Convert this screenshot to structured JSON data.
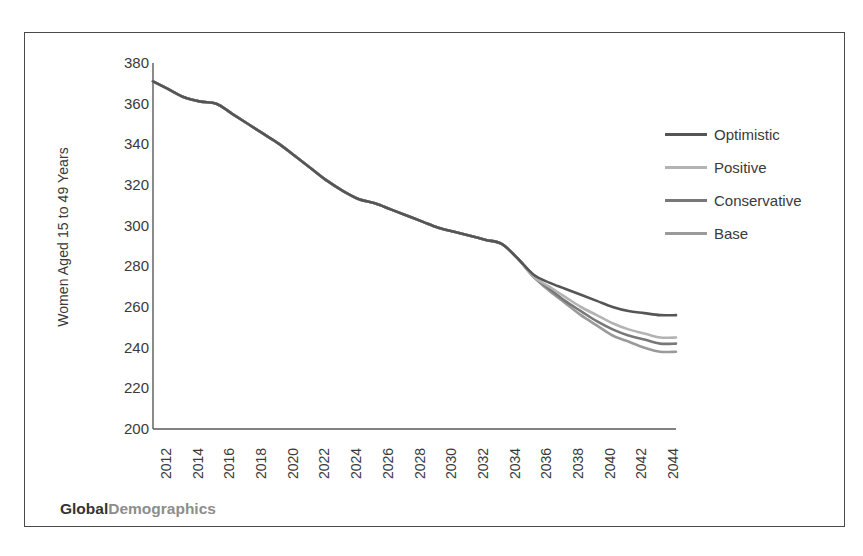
{
  "branding": {
    "primary": "Global",
    "secondary": "Demographics"
  },
  "legend": {
    "position": "inside-right",
    "items": [
      {
        "label": "Optimistic",
        "color": "#555555"
      },
      {
        "label": "Positive",
        "color": "#b3b3b3"
      },
      {
        "label": "Conservative",
        "color": "#787878"
      },
      {
        "label": "Base",
        "color": "#9a9a9a"
      }
    ]
  },
  "chart_data": {
    "type": "line",
    "title": "",
    "subtitle": "",
    "xlabel": "",
    "ylabel": "Women Aged 15 to 49 Years",
    "xlim": [
      2012,
      2045
    ],
    "ylim": [
      200,
      380
    ],
    "yticks": [
      200,
      220,
      240,
      260,
      280,
      300,
      320,
      340,
      360,
      380
    ],
    "xticks": [
      2012,
      2014,
      2016,
      2018,
      2020,
      2022,
      2024,
      2026,
      2028,
      2030,
      2032,
      2034,
      2036,
      2038,
      2040,
      2042,
      2044
    ],
    "grid": false,
    "legend_position": "inside-right",
    "x": [
      2012,
      2013,
      2014,
      2015,
      2016,
      2017,
      2018,
      2019,
      2020,
      2021,
      2022,
      2023,
      2024,
      2025,
      2026,
      2027,
      2028,
      2029,
      2030,
      2031,
      2032,
      2033,
      2034,
      2035,
      2036,
      2037,
      2038,
      2039,
      2040,
      2041,
      2042,
      2043,
      2044,
      2045
    ],
    "series": [
      {
        "name": "Optimistic",
        "color": "#555555",
        "values": [
          371,
          367,
          363,
          361,
          360,
          355,
          350,
          345,
          340,
          334,
          328,
          322,
          317,
          313,
          311,
          308,
          305,
          302,
          299,
          297,
          295,
          293,
          291,
          284,
          276,
          272,
          269,
          266,
          263,
          260,
          258,
          257,
          256,
          256
        ]
      },
      {
        "name": "Positive",
        "color": "#b3b3b3",
        "values": [
          371,
          367,
          363,
          361,
          360,
          355,
          350,
          345,
          340,
          334,
          328,
          322,
          317,
          313,
          311,
          308,
          305,
          302,
          299,
          297,
          295,
          293,
          291,
          284,
          275,
          270,
          265,
          260,
          256,
          252,
          249,
          247,
          245,
          245
        ]
      },
      {
        "name": "Conservative",
        "color": "#787878",
        "values": [
          371,
          367,
          363,
          361,
          360,
          355,
          350,
          345,
          340,
          334,
          328,
          322,
          317,
          313,
          311,
          308,
          305,
          302,
          299,
          297,
          295,
          293,
          291,
          284,
          275,
          269,
          263,
          258,
          253,
          249,
          246,
          244,
          242,
          242
        ]
      },
      {
        "name": "Base",
        "color": "#9a9a9a",
        "values": [
          371,
          367,
          363,
          361,
          360,
          355,
          350,
          345,
          340,
          334,
          328,
          322,
          317,
          313,
          311,
          308,
          305,
          302,
          299,
          297,
          295,
          293,
          291,
          284,
          275,
          268,
          262,
          256,
          251,
          246,
          243,
          240,
          238,
          238
        ]
      }
    ]
  }
}
